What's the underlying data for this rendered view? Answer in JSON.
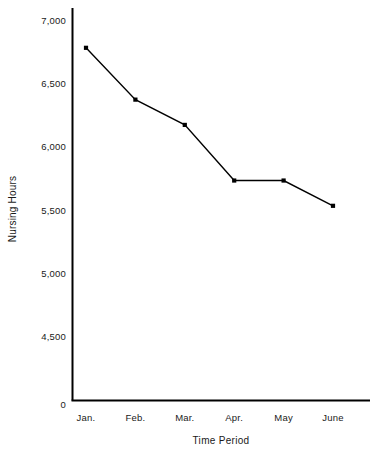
{
  "chart_data": {
    "type": "line",
    "title": "",
    "subtitle": "",
    "xlabel": "Time Period",
    "ylabel": "Nursing Hours",
    "categories": [
      "Jan.",
      "Feb.",
      "Mar.",
      "Apr.",
      "May",
      "June"
    ],
    "values": [
      6780,
      6370,
      6170,
      5730,
      5730,
      5530
    ],
    "series": [
      {
        "name": "Nursing Hours",
        "values": [
          6780,
          6370,
          6170,
          5730,
          5730,
          5530
        ]
      }
    ],
    "ylim": [
      0,
      7150
    ],
    "y_tick_labels": [
      "7,000",
      "6,500",
      "6,000",
      "5,500",
      "5,000",
      "4,500",
      "0"
    ],
    "y_tick_values": [
      7000,
      6500,
      6000,
      5500,
      5000,
      4500,
      0
    ],
    "x_tick_labels": [
      "Jan.",
      "Feb.",
      "Mar.",
      "Apr.",
      "May",
      "June"
    ],
    "grid": false,
    "legend": false,
    "legend_position": "none",
    "marker": "square",
    "line_color": "#000000",
    "marker_color": "#000000",
    "axis_color": "#000000",
    "background_color": "#ffffff"
  },
  "axes": {
    "y_title": "Nursing Hours",
    "x_title": "Time Period"
  }
}
